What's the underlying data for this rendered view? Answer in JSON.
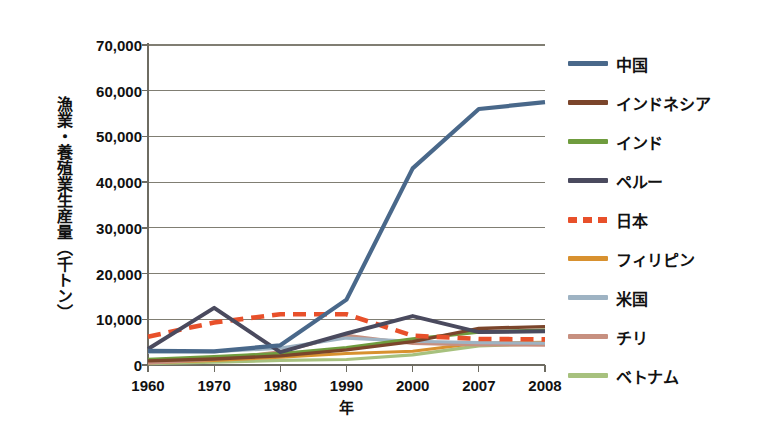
{
  "chart_data": {
    "type": "line",
    "title": "",
    "xlabel": "年",
    "ylabel": "漁業・養殖業生産量（千トン）",
    "categories": [
      "1960",
      "1970",
      "1980",
      "1990",
      "2000",
      "2007",
      "2008"
    ],
    "ylim": [
      0,
      70000
    ],
    "yticks": [
      0,
      10000,
      20000,
      30000,
      40000,
      50000,
      60000,
      70000
    ],
    "ytick_labels": [
      "0",
      "10,000",
      "20,000",
      "30,000",
      "40,000",
      "50,000",
      "60,000",
      "70,000"
    ],
    "grid": true,
    "legend_position": "right",
    "series": [
      {
        "name": "中国",
        "color": "#49688a",
        "style": "solid",
        "width": 4.2,
        "values": [
          3100,
          3000,
          4300,
          14300,
          43000,
          56000,
          57500
        ]
      },
      {
        "name": "インドネシア",
        "color": "#7b452b",
        "style": "solid",
        "width": 3.4,
        "values": [
          900,
          1300,
          2000,
          3300,
          5100,
          8000,
          8400
        ]
      },
      {
        "name": "インド",
        "color": "#6f9c3e",
        "style": "solid",
        "width": 3.4,
        "values": [
          1200,
          1800,
          2500,
          3800,
          5700,
          7200,
          7600
        ]
      },
      {
        "name": "ペルー",
        "color": "#4a4a5e",
        "style": "solid",
        "width": 4.0,
        "values": [
          3500,
          12500,
          2800,
          6900,
          10700,
          7200,
          7400
        ]
      },
      {
        "name": "日本",
        "color": "#e8502a",
        "style": "dashed",
        "width": 4.6,
        "values": [
          6200,
          9300,
          11100,
          11100,
          6400,
          5700,
          5600
        ]
      },
      {
        "name": "フィリピン",
        "color": "#d8912f",
        "style": "solid",
        "width": 3.0,
        "values": [
          500,
          1000,
          1700,
          2500,
          3000,
          4800,
          5000
        ]
      },
      {
        "name": "米国",
        "color": "#9eb3c3",
        "style": "solid",
        "width": 3.2,
        "values": [
          2800,
          2900,
          3700,
          5900,
          5200,
          4900,
          4800
        ]
      },
      {
        "name": "チリ",
        "color": "#c79080",
        "style": "solid",
        "width": 3.0,
        "values": [
          400,
          1200,
          2900,
          6500,
          4700,
          4400,
          4300
        ]
      },
      {
        "name": "ベトナム",
        "color": "#a7c17e",
        "style": "solid",
        "width": 3.2,
        "values": [
          300,
          600,
          1000,
          1200,
          2200,
          4200,
          4600
        ]
      }
    ]
  },
  "axis": {
    "y_title": "漁業・養殖業生産量（千トン）",
    "x_title": "年"
  }
}
